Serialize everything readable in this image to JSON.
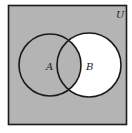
{
  "diagram": {
    "type": "venn",
    "universe_label": "U",
    "sets": [
      {
        "name": "A",
        "label": "A",
        "cx": 50,
        "cy": 65,
        "r": 31
      },
      {
        "name": "B",
        "label": "B",
        "cx": 89,
        "cy": 65,
        "r": 32
      }
    ],
    "shaded_region": "A ∪ Bᶜ",
    "colors": {
      "shade": "#b4b4b4",
      "unshaded": "#ffffff",
      "stroke": "#1a1a1a"
    }
  }
}
